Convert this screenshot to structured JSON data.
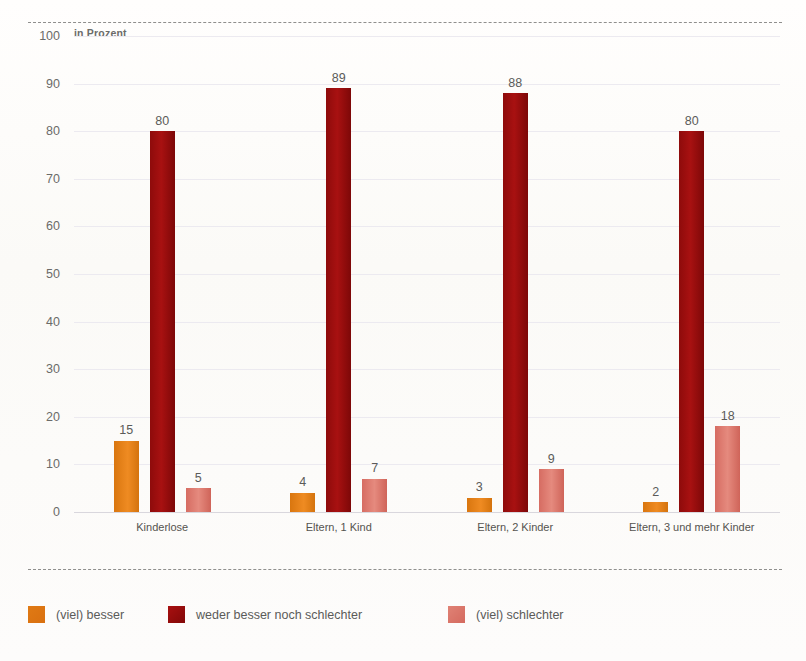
{
  "chart_data": {
    "type": "bar",
    "title": "",
    "subtitle": "",
    "unit_label": "in Prozent",
    "xlabel": "",
    "ylabel": "",
    "ylim": [
      0,
      100
    ],
    "yticks": [
      100,
      90,
      80,
      70,
      60,
      50,
      40,
      30,
      20,
      10,
      0
    ],
    "grid": true,
    "legend_position": "bottom",
    "categories": [
      "Kinderlose",
      "Eltern, 1 Kind",
      "Eltern, 2 Kinder",
      "Eltern, 3 und mehr Kinder"
    ],
    "series": [
      {
        "name": "(viel) besser",
        "color": "#e07a14",
        "values": [
          15,
          4,
          3,
          2
        ]
      },
      {
        "name": "weder besser noch schlechter",
        "color": "#a81010",
        "values": [
          80,
          89,
          88,
          80
        ]
      },
      {
        "name": "(viel) schlechter",
        "color": "#e08275",
        "values": [
          5,
          7,
          9,
          18
        ]
      }
    ]
  },
  "legend": {
    "items": [
      {
        "label": "(viel) besser"
      },
      {
        "label": "weder besser noch schlechter"
      },
      {
        "label": "(viel) schlechter"
      }
    ]
  }
}
